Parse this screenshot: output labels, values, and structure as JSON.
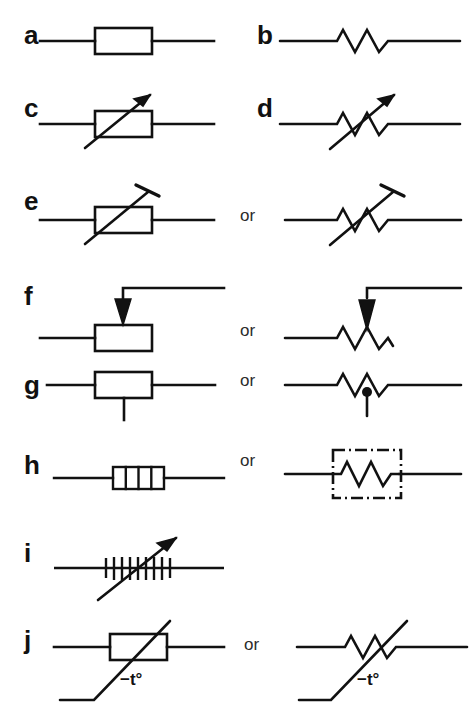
{
  "figure": {
    "background_color": "#ffffff",
    "ink_color": "#111111",
    "or_text": "or",
    "rows": [
      {
        "key": "a",
        "label": "a",
        "description": "Fixed resistor, rectangular box (IEC) symbol",
        "has_alternative": false,
        "left_symbol": "resistor-box",
        "right_symbol": null,
        "annotation": null
      },
      {
        "key": "b",
        "label": "b",
        "description": "Fixed resistor, zigzag (ANSI) symbol",
        "has_alternative": false,
        "left_symbol": "resistor-zigzag",
        "right_symbol": null,
        "annotation": null
      },
      {
        "key": "c",
        "label": "c",
        "description": "Variable resistor (rheostat), box with arrow",
        "has_alternative": false,
        "left_symbol": "variable-resistor-box",
        "right_symbol": null,
        "annotation": null
      },
      {
        "key": "d",
        "label": "d",
        "description": "Variable resistor (rheostat), zigzag with arrow",
        "has_alternative": false,
        "left_symbol": "variable-resistor-zigzag",
        "right_symbol": null,
        "annotation": null
      },
      {
        "key": "e",
        "label": "e",
        "description": "Preset / trimmer resistor, box and zigzag forms",
        "has_alternative": true,
        "left_symbol": "preset-resistor-box",
        "right_symbol": "preset-resistor-zigzag",
        "annotation": null
      },
      {
        "key": "f",
        "label": "f",
        "description": "Potentiometer with wiper arrow, box and zigzag forms",
        "has_alternative": true,
        "left_symbol": "potentiometer-box",
        "right_symbol": "potentiometer-zigzag",
        "annotation": null
      },
      {
        "key": "g",
        "label": "g",
        "description": "Tapped resistor, box and zigzag with dot forms",
        "has_alternative": true,
        "left_symbol": "tapped-resistor-box",
        "right_symbol": "tapped-resistor-zigzag",
        "annotation": null
      },
      {
        "key": "h",
        "label": "h",
        "description": "Resistor network / array, segmented box and dash-dot enclosure forms",
        "has_alternative": true,
        "left_symbol": "resistor-network-segmented-box",
        "right_symbol": "resistor-network-dashdot-box",
        "annotation": null
      },
      {
        "key": "i",
        "label": "i",
        "description": "Variable wirewound resistor, hatched bars with arrow",
        "has_alternative": false,
        "left_symbol": "wirewound-variable-resistor",
        "right_symbol": null,
        "annotation": null
      },
      {
        "key": "j",
        "label": "j",
        "description": "Thermistor with negative temperature coefficient, box and zigzag forms",
        "has_alternative": true,
        "left_symbol": "thermistor-ntc-box",
        "right_symbol": "thermistor-ntc-zigzag",
        "annotation": "−t°"
      }
    ]
  }
}
